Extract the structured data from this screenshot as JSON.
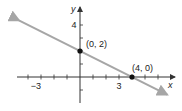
{
  "chart_data": {
    "type": "line",
    "title": "",
    "xlabel": "x",
    "ylabel": "y",
    "xlim": [
      -4.7,
      7.2
    ],
    "ylim": [
      -2,
      5.3
    ],
    "grid": false,
    "x_tick_labels": [
      {
        "value": -3,
        "label": "−3"
      },
      {
        "value": 3,
        "label": "3"
      }
    ],
    "y_tick_labels": [
      {
        "value": 4,
        "label": "4"
      }
    ],
    "x_ticks": [
      -4,
      -3,
      -2,
      -1,
      1,
      2,
      3,
      4,
      5,
      6
    ],
    "y_ticks": [
      -1,
      1,
      2,
      3,
      4
    ],
    "series": [
      {
        "name": "line",
        "equation": "y = -x/2 + 2",
        "x": [
          -4.7,
          6.7
        ],
        "y": [
          4.35,
          -1.35
        ],
        "color": "#a6a6a6",
        "arrows": "both"
      }
    ],
    "points": [
      {
        "x": 0,
        "y": 2,
        "label": "(0, 2)"
      },
      {
        "x": 4,
        "y": 0,
        "label": "(4, 0)"
      }
    ]
  }
}
